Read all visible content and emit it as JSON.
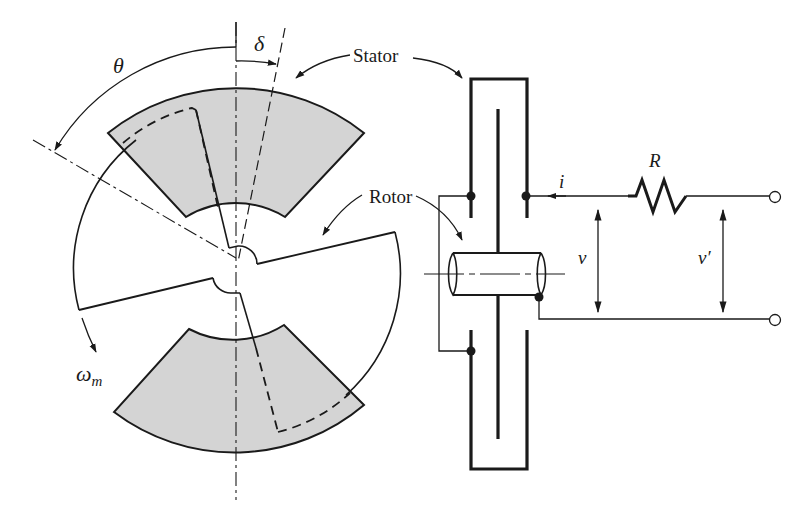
{
  "figure": {
    "type": "electromechanical diagram"
  },
  "labels": {
    "theta": "θ",
    "delta": "δ",
    "stator": "Stator",
    "rotor": "Rotor",
    "omega_m": "ω",
    "omega_sub": "m",
    "current": "i",
    "resistor": "R",
    "voltage": "v",
    "voltage_prime": "v′"
  },
  "colors": {
    "stroke": "#1a1a1a",
    "stator_fill": "#d4d4d4",
    "background": "#ffffff"
  }
}
